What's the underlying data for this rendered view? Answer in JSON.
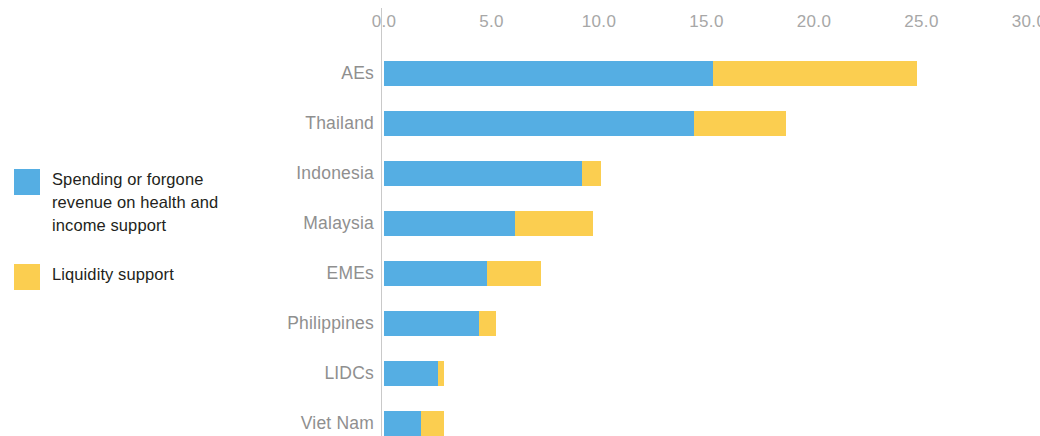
{
  "chart_data": {
    "type": "bar",
    "orientation": "horizontal",
    "stacked": true,
    "title": "",
    "subtitle": "",
    "xlabel": "",
    "ylabel": "",
    "xlim": [
      0.0,
      30.0
    ],
    "xticks": [
      "0.0",
      "5.0",
      "10.0",
      "15.0",
      "20.0",
      "25.0",
      "30.0"
    ],
    "xtick_values": [
      0.0,
      5.0,
      10.0,
      15.0,
      20.0,
      25.0,
      30.0
    ],
    "grid": false,
    "legend_position": "left",
    "categories": [
      "AEs",
      "Thailand",
      "Indonesia",
      "Malaysia",
      "EMEs",
      "Philippines",
      "LIDCs",
      "Viet Nam"
    ],
    "series": [
      {
        "name": "Spending or forgone revenue on health and income support",
        "color": "#55AEE3",
        "values": [
          15.3,
          14.4,
          9.2,
          6.1,
          4.8,
          4.4,
          2.5,
          1.7
        ]
      },
      {
        "name": "Liquidity support",
        "color": "#FBCE50",
        "values": [
          9.5,
          4.3,
          0.9,
          3.6,
          2.5,
          0.8,
          0.3,
          1.1
        ]
      }
    ],
    "totals": [
      24.8,
      18.7,
      10.1,
      9.7,
      7.3,
      5.2,
      2.8,
      2.8
    ]
  },
  "legend": {
    "items": [
      {
        "label": "Spending or forgone revenue on health and income support",
        "color": "#55AEE3"
      },
      {
        "label": "Liquidity support",
        "color": "#FBCE50"
      }
    ]
  },
  "axis": {
    "ticks": [
      "0.0",
      "5.0",
      "10.0",
      "15.0",
      "20.0",
      "25.0",
      "30.0"
    ]
  }
}
